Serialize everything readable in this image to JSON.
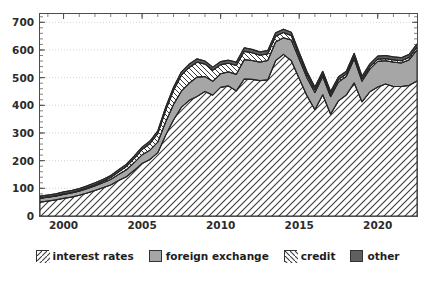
{
  "chart_data": {
    "type": "area",
    "title": "",
    "subtitle": "",
    "xlabel": "",
    "ylabel": "",
    "stacked": true,
    "grid": true,
    "legend_position": "bottom",
    "xlim": [
      1998.5,
      2022.5
    ],
    "ylim": [
      0,
      730
    ],
    "y_ticks": [
      0,
      100,
      200,
      300,
      400,
      500,
      600,
      700
    ],
    "y_tick_labels": [
      "0",
      "100",
      "200",
      "300",
      "400",
      "500",
      "600",
      "700"
    ],
    "y_minor_tick_step": 20,
    "x_ticks": [
      2000,
      2005,
      2010,
      2015,
      2020
    ],
    "x_tick_labels": [
      "2000",
      "2005",
      "2010",
      "2015",
      "2020"
    ],
    "x_minor_tick_step": 1,
    "x": [
      1998.5,
      1999.0,
      1999.5,
      2000.0,
      2000.5,
      2001.0,
      2001.5,
      2002.0,
      2002.5,
      2003.0,
      2003.5,
      2004.0,
      2004.5,
      2005.0,
      2005.5,
      2006.0,
      2006.5,
      2007.0,
      2007.5,
      2008.0,
      2008.5,
      2009.0,
      2009.5,
      2010.0,
      2010.5,
      2011.0,
      2011.5,
      2012.0,
      2012.5,
      2013.0,
      2013.5,
      2014.0,
      2014.5,
      2015.0,
      2015.5,
      2016.0,
      2016.5,
      2017.0,
      2017.5,
      2018.0,
      2018.5,
      2019.0,
      2019.5,
      2020.0,
      2020.5,
      2021.0,
      2021.5,
      2022.0,
      2022.5
    ],
    "series": [
      {
        "name": "interest rates",
        "pattern": "forward-hatch",
        "color": "#ffffff",
        "values": [
          50,
          54,
          58,
          64,
          68,
          75,
          83,
          92,
          102,
          112,
          128,
          142,
          165,
          190,
          204,
          229,
          292,
          347,
          393,
          418,
          432,
          450,
          437,
          465,
          470,
          452,
          495,
          494,
          489,
          492,
          561,
          584,
          561,
          497,
          434,
          384,
          438,
          368,
          416,
          437,
          481,
          412,
          449,
          466,
          477,
          468,
          468,
          472,
          488
        ]
      },
      {
        "name": "foreign exchange",
        "pattern": "solid",
        "color": "#a6a6a6",
        "values": [
          14,
          14,
          14,
          14,
          15,
          15,
          16,
          17,
          18,
          20,
          22,
          25,
          28,
          31,
          34,
          38,
          48,
          56,
          58,
          62,
          70,
          54,
          50,
          49,
          51,
          60,
          70,
          68,
          67,
          70,
          68,
          60,
          75,
          70,
          65,
          62,
          66,
          63,
          68,
          67,
          87,
          75,
          82,
          93,
          84,
          88,
          85,
          92,
          112
        ]
      },
      {
        "name": "credit",
        "pattern": "backward-hatch",
        "color": "#ffffff",
        "values": [
          1,
          1,
          1,
          2,
          2,
          2,
          3,
          4,
          5,
          7,
          9,
          12,
          15,
          19,
          24,
          31,
          42,
          51,
          58,
          57,
          54,
          45,
          40,
          33,
          31,
          32,
          30,
          28,
          25,
          24,
          21,
          19,
          16,
          13,
          11,
          10,
          9,
          9,
          9,
          9,
          9,
          8,
          8,
          8,
          8,
          8,
          8,
          9,
          10
        ]
      },
      {
        "name": "other",
        "pattern": "solid",
        "color": "#5f5f5f",
        "values": [
          7,
          7,
          7,
          7,
          7,
          7,
          7,
          7,
          7,
          7,
          8,
          8,
          9,
          9,
          9,
          10,
          11,
          11,
          12,
          12,
          12,
          11,
          11,
          11,
          11,
          12,
          13,
          12,
          12,
          12,
          12,
          12,
          12,
          11,
          11,
          10,
          10,
          10,
          10,
          10,
          11,
          10,
          11,
          11,
          11,
          11,
          11,
          11,
          12
        ]
      }
    ],
    "annotations": []
  },
  "legend": {
    "items": [
      {
        "label": "interest rates",
        "swatch": "forward-hatch-swatch"
      },
      {
        "label": "foreign exchange",
        "swatch": "solid-gray-swatch"
      },
      {
        "label": "credit",
        "swatch": "backward-hatch-swatch"
      },
      {
        "label": "other",
        "swatch": "solid-dark-swatch"
      }
    ]
  },
  "colors": {
    "foreign_exchange": "#a6a6a6",
    "other": "#5f5f5f",
    "line": "#262626",
    "axis": "#4d4d4d",
    "grid": "#c8c8c8",
    "text": "#2b2b2b",
    "background": "#ffffff"
  }
}
